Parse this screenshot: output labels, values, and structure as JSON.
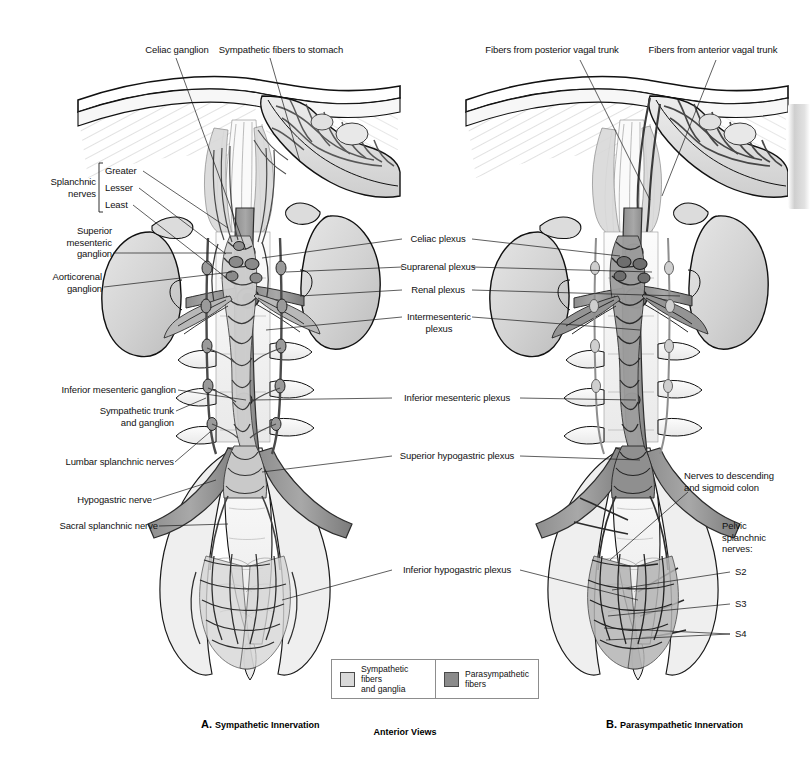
{
  "plate": {
    "title_caption_center": "Anterior Views",
    "panels": [
      {
        "letter": "A.",
        "name": "Sympathetic Innervation"
      },
      {
        "letter": "B.",
        "name": "Parasympathetic Innervation"
      }
    ]
  },
  "legend": {
    "items": [
      {
        "label": "Sympathetic fibers\nand ganglia",
        "color": "#d9d9d9",
        "swatch_name": "sympathetic-swatch"
      },
      {
        "label": "Parasympathetic\nfibers",
        "color": "#8b8b8b",
        "swatch_name": "parasympathetic-swatch"
      }
    ]
  },
  "panel_a": {
    "top_labels": [
      {
        "text": "Celiac ganglion"
      },
      {
        "text": "Sympathetic fibers to stomach"
      }
    ],
    "bracket_group": {
      "group_label": "Splanchnic\nnerves",
      "items": [
        "Greater",
        "Lesser",
        "Least"
      ]
    },
    "left_labels": [
      {
        "text": "Superior\nmesenteric\nganglion"
      },
      {
        "text": "Aorticorenal\nganglion"
      },
      {
        "text": "Inferior mesenteric ganglion"
      },
      {
        "text": "Sympathetic trunk\nand ganglion"
      },
      {
        "text": "Lumbar splanchnic nerves"
      },
      {
        "text": "Hypogastric nerve"
      },
      {
        "text": "Sacral splanchnic nerve"
      }
    ]
  },
  "center_labels": [
    {
      "text": "Celiac plexus"
    },
    {
      "text": "Suprarenal plexus"
    },
    {
      "text": "Renal plexus"
    },
    {
      "text": "Intermesenteric\nplexus"
    },
    {
      "text": "Inferior mesenteric plexus"
    },
    {
      "text": "Superior hypogastric plexus"
    },
    {
      "text": "Inferior hypogastric plexus"
    }
  ],
  "panel_b": {
    "top_labels": [
      {
        "text": "Fibers from posterior vagal trunk"
      },
      {
        "text": "Fibers from anterior vagal trunk"
      }
    ],
    "right_labels": [
      {
        "text": "Nerves to descending\nand sigmoid colon"
      },
      {
        "text": "Pelvic\nsplanchnic\nnerves:"
      },
      {
        "text": "S2"
      },
      {
        "text": "S3"
      },
      {
        "text": "S4"
      }
    ]
  },
  "colors": {
    "background": "#ffffff",
    "ink": "#1a1a1a",
    "sympathetic_fill": "#d9d9d9",
    "parasympathetic_fill": "#8b8b8b",
    "organ_fill": "#d5d5d5",
    "bone_fill": "#f3f3f3",
    "vessel_fill": "#9a9a9a"
  }
}
